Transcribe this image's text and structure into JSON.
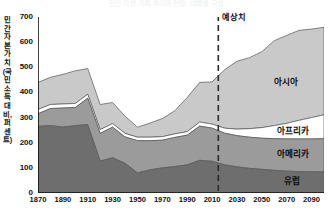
{
  "chart_data": {
    "type": "area",
    "stacked": true,
    "title": "민간 자본 가치 추이와 전망: 대륙별 구성",
    "xlabel": "",
    "ylabel": "민간 자본 가치(국민소득 대비, 퍼센트)",
    "xlim": [
      1870,
      2100
    ],
    "ylim": [
      0,
      700
    ],
    "ytick_step": 100,
    "yticks": [
      0,
      100,
      200,
      300,
      400,
      500,
      600,
      700
    ],
    "xticks": [
      1870,
      1890,
      1910,
      1930,
      1950,
      1970,
      1990,
      2010,
      2030,
      2050,
      2070,
      2090
    ],
    "grid": false,
    "legend_position": "inline-right",
    "x": [
      1870,
      1880,
      1890,
      1900,
      1910,
      1920,
      1930,
      1940,
      1950,
      1960,
      1970,
      1980,
      1990,
      2000,
      2010,
      2020,
      2030,
      2040,
      2050,
      2060,
      2070,
      2080,
      2090,
      2100
    ],
    "series": [
      {
        "name": "유럽",
        "color": "#6e6e6e",
        "values": [
          265,
          268,
          262,
          268,
          272,
          127,
          140,
          118,
          80,
          92,
          100,
          105,
          112,
          130,
          126,
          112,
          104,
          98,
          94,
          90,
          87,
          85,
          84,
          84
        ]
      },
      {
        "name": "아메리카",
        "color": "#9b9b9b",
        "values": [
          50,
          68,
          76,
          72,
          105,
          110,
          122,
          105,
          128,
          116,
          110,
          116,
          118,
          136,
          132,
          126,
          124,
          124,
          124,
          126,
          128,
          130,
          131,
          132
        ]
      },
      {
        "name": "아프리카",
        "color": "#ffffff",
        "values": [
          17,
          16,
          16,
          16,
          16,
          15,
          14,
          14,
          14,
          14,
          14,
          14,
          14,
          16,
          16,
          20,
          26,
          34,
          42,
          52,
          62,
          74,
          85,
          95
        ]
      },
      {
        "name": "아시아",
        "color": "#c9c9c9",
        "values": [
          108,
          108,
          118,
          130,
          102,
          100,
          84,
          68,
          40,
          56,
          72,
          92,
          136,
          158,
          168,
          232,
          270,
          282,
          302,
          338,
          350,
          358,
          352,
          348
        ]
      }
    ],
    "annotation": {
      "label": "예상치",
      "x": 2015,
      "style": "dashed-vertical-line"
    }
  }
}
